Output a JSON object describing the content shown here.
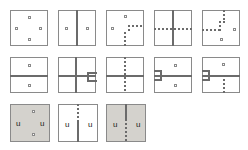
{
  "figure": {
    "title": "",
    "background_color": "#ffffff",
    "stroke_color": "#6b6b6b",
    "border_color": "#8a8a8a",
    "shaded_fill": "#d4d2cd",
    "grid": {
      "rows": 3,
      "cols": 5
    },
    "cell_size_px": 38,
    "node_label": "node-marker",
    "u_label": "u"
  },
  "cells": [
    {
      "id": "r1c1",
      "name": "cell-row1-col1",
      "shaded": false,
      "description": "empty square with four node markers in diamond arrangement",
      "labels": [],
      "nodes": 4
    },
    {
      "id": "r1c2",
      "name": "cell-row1-col2",
      "shaded": false,
      "description": "vertical solid line with one node each side",
      "labels": [],
      "nodes": 2
    },
    {
      "id": "r1c3",
      "name": "cell-row1-col3",
      "shaded": false,
      "description": "dashed staircase path rising from bottom then running right, two nodes",
      "labels": [],
      "nodes": 2
    },
    {
      "id": "r1c4",
      "name": "cell-row1-col4",
      "shaded": false,
      "description": "vertical solid line crossed by horizontal dashed line",
      "labels": [],
      "nodes": 0
    },
    {
      "id": "r1c5",
      "name": "cell-row1-col5",
      "shaded": false,
      "description": "dashed staircase path entering left then rising to top, two nodes",
      "labels": [],
      "nodes": 2
    },
    {
      "id": "r2c1",
      "name": "cell-row2-col1",
      "shaded": false,
      "description": "horizontal solid line with one node above and one below",
      "labels": [],
      "nodes": 2
    },
    {
      "id": "r2c2",
      "name": "cell-row2-col2",
      "shaded": false,
      "description": "solid cross with bracket tab on right edge",
      "labels": [],
      "nodes": 0
    },
    {
      "id": "r2c3",
      "name": "cell-row2-col3",
      "shaded": false,
      "description": "horizontal solid line with vertical dashed line",
      "labels": [],
      "nodes": 0
    },
    {
      "id": "r2c4",
      "name": "cell-row2-col4",
      "shaded": false,
      "description": "horizontal solid line with bracket tab on left edge, node above and below",
      "labels": [],
      "nodes": 2
    },
    {
      "id": "r2c5",
      "name": "cell-row2-col5",
      "shaded": false,
      "description": "horizontal solid line with bracket tab on left edge, node above, vertical dashes below",
      "labels": [],
      "nodes": 1
    },
    {
      "id": "r3c1",
      "name": "cell-row3-col1",
      "shaded": true,
      "description": "shaded square, u on left and right, node above and below",
      "labels": [
        "u",
        "u"
      ],
      "nodes": 2
    },
    {
      "id": "r3c2",
      "name": "cell-row3-col2",
      "shaded": false,
      "description": "white square, vertical line dashed on top half and solid below, u on each side",
      "labels": [
        "u",
        "u"
      ],
      "nodes": 0
    },
    {
      "id": "r3c3",
      "name": "cell-row3-col3",
      "shaded": true,
      "description": "shaded square, vertical line solid on top half and dashed below, u on each side",
      "labels": [
        "u",
        "u"
      ],
      "nodes": 0
    }
  ]
}
